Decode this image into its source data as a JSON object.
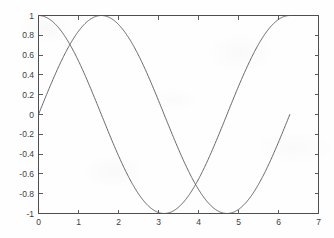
{
  "figure": {
    "background_color": "#fefefe",
    "line_color": "#55555c",
    "axis_color": "#4d4d52",
    "label_color": "#3c3c42"
  },
  "chart_data": {
    "type": "line",
    "title": "",
    "xlabel": "",
    "ylabel": "",
    "xlim": [
      0,
      7
    ],
    "ylim": [
      -1,
      1
    ],
    "xticks": [
      0,
      1,
      2,
      3,
      4,
      5,
      6,
      7
    ],
    "xtick_labels": [
      "0",
      "1",
      "2",
      "3",
      "4",
      "5",
      "6",
      "7"
    ],
    "yticks": [
      -1,
      -0.8,
      -0.6,
      -0.4,
      -0.2,
      0,
      0.2,
      0.4,
      0.6,
      0.8,
      1
    ],
    "ytick_labels": [
      "-1",
      "-0.8",
      "-0.6",
      "-0.4",
      "-0.2",
      "0",
      "0.2",
      "0.4",
      "0.6",
      "0.8",
      "1"
    ],
    "grid": false,
    "legend": null,
    "box": true,
    "tick_direction": "in",
    "x_domain_data": [
      0,
      6.2832
    ],
    "series": [
      {
        "name": "cos(x)",
        "function": "cos",
        "color": "#55555c",
        "x": [
          0,
          0.1571,
          0.3142,
          0.4712,
          0.6283,
          0.7854,
          0.9425,
          1.0996,
          1.2566,
          1.4137,
          1.5708,
          1.7279,
          1.885,
          2.042,
          2.1991,
          2.3562,
          2.5133,
          2.6704,
          2.8274,
          2.9845,
          3.1416,
          3.2987,
          3.4558,
          3.6128,
          3.7699,
          3.927,
          4.0841,
          4.2412,
          4.3982,
          4.5553,
          4.7124,
          4.8695,
          5.0265,
          5.1836,
          5.3407,
          5.4978,
          5.6549,
          5.8119,
          5.969,
          6.1261,
          6.2832
        ],
        "y": [
          1,
          0.9877,
          0.9511,
          0.891,
          0.809,
          0.7071,
          0.5878,
          0.454,
          0.309,
          0.1564,
          0,
          -0.1564,
          -0.309,
          -0.454,
          -0.5878,
          -0.7071,
          -0.809,
          -0.891,
          -0.9511,
          -0.9877,
          -1,
          -0.9877,
          -0.9511,
          -0.891,
          -0.809,
          -0.7071,
          -0.5878,
          -0.454,
          -0.309,
          -0.1564,
          0,
          0.1564,
          0.309,
          0.454,
          0.5878,
          0.7071,
          0.809,
          0.891,
          0.9511,
          0.9877,
          1
        ]
      },
      {
        "name": "sin(x)",
        "function": "sin",
        "color": "#55555c",
        "x": [
          0,
          0.1571,
          0.3142,
          0.4712,
          0.6283,
          0.7854,
          0.9425,
          1.0996,
          1.2566,
          1.4137,
          1.5708,
          1.7279,
          1.885,
          2.042,
          2.1991,
          2.3562,
          2.5133,
          2.6704,
          2.8274,
          2.9845,
          3.1416,
          3.2987,
          3.4558,
          3.6128,
          3.7699,
          3.927,
          4.0841,
          4.2412,
          4.3982,
          4.5553,
          4.7124,
          4.8695,
          5.0265,
          5.1836,
          5.3407,
          5.4978,
          5.6549,
          5.8119,
          5.969,
          6.1261,
          6.2832
        ],
        "y": [
          0,
          0.1564,
          0.309,
          0.454,
          0.5878,
          0.7071,
          0.809,
          0.891,
          0.9511,
          0.9877,
          1,
          0.9877,
          0.9511,
          0.891,
          0.809,
          0.7071,
          0.5878,
          0.454,
          0.309,
          0.1564,
          0,
          -0.1564,
          -0.309,
          -0.454,
          -0.5878,
          -0.7071,
          -0.809,
          -0.891,
          -0.9511,
          -0.9877,
          -1,
          -0.9877,
          -0.9511,
          -0.891,
          -0.809,
          -0.7071,
          -0.5878,
          -0.454,
          -0.309,
          -0.1564,
          0
        ]
      }
    ],
    "annotations": [
      {
        "label": "sin peak",
        "x": 1.5708,
        "y": 1
      },
      {
        "label": "cos minimum",
        "x": 3.1416,
        "y": -1
      },
      {
        "label": "curve intersection",
        "x": 3.927,
        "y": -0.7071
      },
      {
        "label": "sin minimum",
        "x": 4.7124,
        "y": -1
      },
      {
        "label": "cos returns to 1",
        "x": 6.2832,
        "y": 1
      }
    ]
  }
}
